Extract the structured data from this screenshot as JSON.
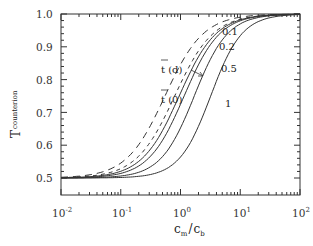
{
  "chart_data": {
    "type": "line",
    "title": "",
    "xlabel": "c_m / c_b",
    "ylabel": "T_counterion",
    "xscale": "log",
    "xlim": [
      0.01,
      100
    ],
    "ylim": [
      0.5,
      1.0
    ],
    "grid": false,
    "legend": "none (inline curve labels)",
    "x_ticks": [
      "10^-2",
      "10^-1",
      "10^0",
      "10^1",
      "10^2"
    ],
    "y_ticks": [
      "0.5",
      "0.6",
      "0.7",
      "0.8",
      "0.9",
      "1.0"
    ],
    "annotations": [
      "t̄(d)",
      "t̄(0)",
      "0.1",
      "0.2",
      "0.5",
      "1"
    ],
    "x": [
      0.01,
      0.03,
      0.1,
      0.3,
      1,
      3,
      10,
      30,
      100
    ],
    "series": [
      {
        "name": "t̄(d) d=0.1 (dashed)",
        "style": "dashed",
        "values": [
          0.502,
          0.51,
          0.56,
          0.68,
          0.85,
          0.96,
          0.99,
          1.0,
          1.0
        ]
      },
      {
        "name": "t̄(0) d=0.1 (dashed)",
        "style": "dashed",
        "values": [
          0.501,
          0.505,
          0.53,
          0.62,
          0.8,
          0.93,
          0.98,
          0.995,
          1.0
        ]
      },
      {
        "name": "0.1 (solid)",
        "style": "solid",
        "values": [
          0.501,
          0.505,
          0.525,
          0.61,
          0.78,
          0.92,
          0.98,
          0.995,
          1.0
        ]
      },
      {
        "name": "0.2 (solid)",
        "style": "solid",
        "values": [
          0.501,
          0.504,
          0.52,
          0.59,
          0.75,
          0.9,
          0.97,
          0.99,
          1.0
        ]
      },
      {
        "name": "0.5 (solid)",
        "style": "solid",
        "values": [
          0.5,
          0.503,
          0.515,
          0.56,
          0.69,
          0.85,
          0.95,
          0.985,
          0.997
        ]
      },
      {
        "name": "1 (solid)",
        "style": "solid",
        "values": [
          0.5,
          0.502,
          0.51,
          0.54,
          0.63,
          0.78,
          0.91,
          0.97,
          0.99
        ]
      }
    ]
  },
  "labels": {
    "y_axis_main": "T",
    "y_axis_sub": "counterion",
    "x_axis_cm": "c",
    "x_axis_cm_sub": "m",
    "x_axis_slash": "/",
    "x_axis_cb": "c",
    "x_axis_cb_sub": "b",
    "td": "t (d)",
    "t0": "t (0)",
    "l01": "0.1",
    "l02": "0.2",
    "l05": "0.5",
    "l1": "1",
    "yt": [
      "0.5",
      "0.6",
      "0.7",
      "0.8",
      "0.9",
      "1.0"
    ],
    "xt_base": "10",
    "xt_exp": [
      "-2",
      "-1",
      "0",
      "1",
      "2"
    ]
  }
}
